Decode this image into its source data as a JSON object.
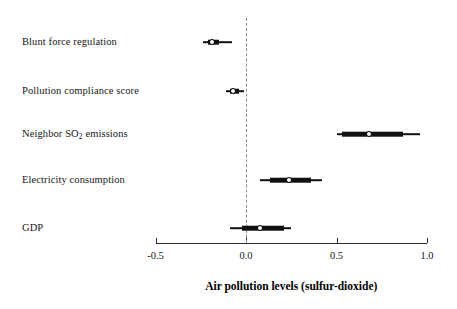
{
  "chart_data": {
    "type": "scatter",
    "subtype": "coefficient-forest-plot",
    "title": "",
    "xlabel": "Air pollution levels (sulfur-dioxide)",
    "ylabel": "",
    "xlim": [
      -0.72,
      1.05
    ],
    "xticks": [
      -0.5,
      0.0,
      0.5,
      1.0
    ],
    "xticklabels": [
      "-0.5",
      "0.0",
      "0.5",
      "1.0"
    ],
    "grid": false,
    "legend": null,
    "reference_line": {
      "value": 0.0,
      "style": "dashed",
      "color": "#8a8a8a"
    },
    "categories": [
      "Blunt force regulation",
      "Pollution compliance score",
      "Neighbor SO2 emissions",
      "Electricity consumption",
      "GDP"
    ],
    "estimates": [
      -0.19,
      -0.07,
      0.68,
      0.24,
      0.08
    ],
    "inner_ci_low": [
      -0.21,
      -0.09,
      0.53,
      0.13,
      -0.02
    ],
    "inner_ci_high": [
      -0.15,
      -0.04,
      0.87,
      0.36,
      0.21
    ],
    "outer_ci_low": [
      -0.24,
      -0.11,
      0.5,
      0.08,
      -0.09
    ],
    "outer_ci_high": [
      -0.08,
      -0.01,
      0.96,
      0.42,
      0.25
    ],
    "point_color": "#ffffff",
    "point_edge_color": "#000000",
    "interval_color": "#111111"
  },
  "axis": {
    "title": "Air pollution levels (sulfur-dioxide)",
    "tick_labels": [
      "-0.5",
      "0.0",
      "0.5",
      "1.0"
    ]
  },
  "rows": [
    {
      "label_prefix": "Blunt force regulation",
      "sub": "",
      "label_suffix": ""
    },
    {
      "label_prefix": "Pollution compliance score",
      "sub": "",
      "label_suffix": ""
    },
    {
      "label_prefix": "Neighbor SO",
      "sub": "2",
      "label_suffix": " emissions"
    },
    {
      "label_prefix": "Electricity consumption",
      "sub": "",
      "label_suffix": ""
    },
    {
      "label_prefix": "GDP",
      "sub": "",
      "label_suffix": ""
    }
  ]
}
